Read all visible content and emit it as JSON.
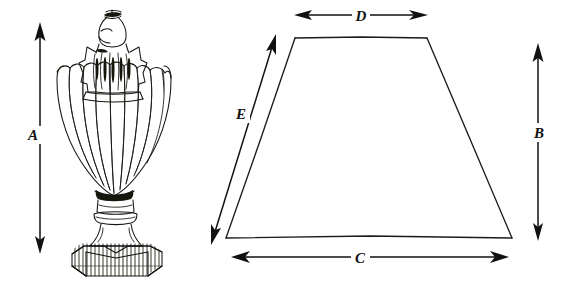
{
  "diagram": {
    "background_color": "#ffffff",
    "ink_color": "#14140f",
    "width": 576,
    "height": 283,
    "objects": [
      {
        "name": "urn-finial-lamp-body",
        "description": "Hand-drawn ornamental urn / finial with acorn knop, fluted star collar, melon-ribbed bowl, turned stem and hatched square plinth base"
      },
      {
        "name": "shade-trapezoid",
        "description": "Hand-drawn trapezoid representing a lamp shade profile"
      }
    ],
    "dimensions": [
      {
        "key": "A",
        "label": "A",
        "measures": "lamp-body-height",
        "orientation": "vertical",
        "arrow": "double",
        "target": "urn-finial-lamp-body"
      },
      {
        "key": "B",
        "label": "B",
        "measures": "shade-height",
        "orientation": "vertical",
        "arrow": "double",
        "target": "shade-trapezoid"
      },
      {
        "key": "C",
        "label": "C",
        "measures": "shade-bottom-width",
        "orientation": "horizontal",
        "arrow": "double",
        "target": "shade-trapezoid"
      },
      {
        "key": "D",
        "label": "D",
        "measures": "shade-top-width",
        "orientation": "horizontal",
        "arrow": "double",
        "target": "shade-trapezoid"
      },
      {
        "key": "E",
        "label": "E",
        "measures": "shade-slant-side",
        "orientation": "diagonal",
        "arrow": "double",
        "target": "shade-trapezoid"
      }
    ]
  },
  "labels": {
    "a": "A",
    "b": "B",
    "c": "C",
    "d": "D",
    "e": "E"
  }
}
